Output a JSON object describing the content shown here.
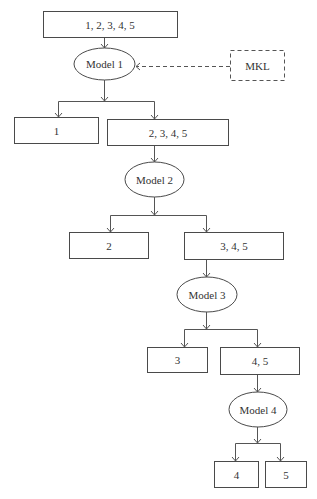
{
  "diagram": {
    "type": "hierarchical-classification-flowchart",
    "nodes": {
      "root": {
        "label": "1, 2, 3, 4, 5",
        "shape": "rect"
      },
      "mkl": {
        "label": "MKL",
        "shape": "dashed-rect"
      },
      "model1": {
        "label": "Model 1",
        "shape": "ellipse"
      },
      "leaf1": {
        "label": "1",
        "shape": "rect"
      },
      "set2345": {
        "label": "2, 3, 4, 5",
        "shape": "rect"
      },
      "model2": {
        "label": "Model 2",
        "shape": "ellipse"
      },
      "leaf2": {
        "label": "2",
        "shape": "rect"
      },
      "set345": {
        "label": "3, 4, 5",
        "shape": "rect"
      },
      "model3": {
        "label": "Model 3",
        "shape": "ellipse"
      },
      "leaf3": {
        "label": "3",
        "shape": "rect"
      },
      "set45": {
        "label": "4, 5",
        "shape": "rect"
      },
      "model4": {
        "label": "Model 4",
        "shape": "ellipse"
      },
      "leaf4": {
        "label": "4",
        "shape": "rect"
      },
      "leaf5": {
        "label": "5",
        "shape": "rect"
      }
    },
    "edges": [
      {
        "from": "root",
        "to": "model1",
        "style": "solid"
      },
      {
        "from": "mkl",
        "to": "model1",
        "style": "dashed"
      },
      {
        "from": "model1",
        "to": "leaf1",
        "style": "solid"
      },
      {
        "from": "model1",
        "to": "set2345",
        "style": "solid"
      },
      {
        "from": "set2345",
        "to": "model2",
        "style": "solid"
      },
      {
        "from": "model2",
        "to": "leaf2",
        "style": "solid"
      },
      {
        "from": "model2",
        "to": "set345",
        "style": "solid"
      },
      {
        "from": "set345",
        "to": "model3",
        "style": "solid"
      },
      {
        "from": "model3",
        "to": "leaf3",
        "style": "solid"
      },
      {
        "from": "model3",
        "to": "set45",
        "style": "solid"
      },
      {
        "from": "set45",
        "to": "model4",
        "style": "solid"
      },
      {
        "from": "model4",
        "to": "leaf4",
        "style": "solid"
      },
      {
        "from": "model4",
        "to": "leaf5",
        "style": "solid"
      }
    ],
    "colors": {
      "stroke": "#4a4a4a",
      "text": "#333333",
      "background": "#ffffff"
    }
  }
}
